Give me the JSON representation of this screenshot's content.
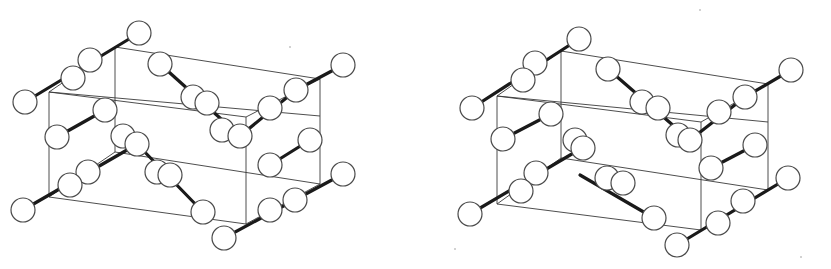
{
  "figure": {
    "kind": "stereo-pair crystal structure (ball-and-stick, unit cell outlined)",
    "colors": {
      "background": "#ffffff",
      "atom_fill": "#ffffff",
      "atom_stroke": "#4a4a4a",
      "bond": "#1a1a1a",
      "frame": "#3a3a3a"
    },
    "atom_radius": 12,
    "views": [
      {
        "name": "left-view",
        "offset": [
          0,
          0
        ],
        "frame_lines": [
          [
            115,
            47,
            320,
            79
          ],
          [
            49,
            92,
            320,
            116
          ],
          [
            49,
            92,
            49,
            197
          ],
          [
            115,
            47,
            115,
            152
          ],
          [
            320,
            79,
            320,
            184
          ],
          [
            49,
            197,
            246,
            224
          ],
          [
            115,
            152,
            320,
            184
          ],
          [
            246,
            117,
            246,
            224
          ],
          [
            49,
            92,
            115,
            47
          ],
          [
            49,
            197,
            115,
            152
          ],
          [
            246,
            117,
            320,
            79
          ],
          [
            246,
            224,
            320,
            184
          ],
          [
            49,
            92,
            246,
            117
          ]
        ],
        "bonds": [
          [
            25,
            102,
            139,
            33
          ],
          [
            160,
            64,
            240,
            136
          ],
          [
            240,
            136,
            296,
            90
          ],
          [
            296,
            90,
            343,
            65
          ],
          [
            57,
            137,
            105,
            110
          ],
          [
            23,
            210,
            127,
            150
          ],
          [
            137,
            144,
            203,
            212
          ],
          [
            224,
            238,
            343,
            174
          ],
          [
            270,
            165,
            310,
            140
          ]
        ],
        "atoms": [
          [
            139,
            33
          ],
          [
            90,
            60
          ],
          [
            73,
            78
          ],
          [
            25,
            102
          ],
          [
            160,
            64
          ],
          [
            193,
            97
          ],
          [
            207,
            103
          ],
          [
            222,
            130
          ],
          [
            240,
            136
          ],
          [
            270,
            108
          ],
          [
            296,
            90
          ],
          [
            343,
            65
          ],
          [
            105,
            110
          ],
          [
            57,
            137
          ],
          [
            123,
            136
          ],
          [
            137,
            144
          ],
          [
            88,
            172
          ],
          [
            70,
            185
          ],
          [
            23,
            210
          ],
          [
            157,
            172
          ],
          [
            170,
            175
          ],
          [
            203,
            212
          ],
          [
            270,
            165
          ],
          [
            310,
            140
          ],
          [
            270,
            210
          ],
          [
            295,
            200
          ],
          [
            343,
            174
          ],
          [
            224,
            238
          ]
        ]
      },
      {
        "name": "right-view",
        "offset": [
          0,
          0
        ],
        "frame_lines": [
          [
            561,
            51,
            768,
            84
          ],
          [
            497,
            96,
            768,
            122
          ],
          [
            497,
            96,
            497,
            204
          ],
          [
            561,
            51,
            561,
            158
          ],
          [
            768,
            84,
            768,
            190
          ],
          [
            497,
            204,
            701,
            230
          ],
          [
            561,
            158,
            768,
            190
          ],
          [
            701,
            122,
            701,
            230
          ],
          [
            497,
            96,
            561,
            51
          ],
          [
            497,
            204,
            561,
            158
          ],
          [
            701,
            122,
            768,
            84
          ],
          [
            701,
            230,
            768,
            190
          ],
          [
            497,
            96,
            701,
            122
          ]
        ],
        "bonds": [
          [
            472,
            108,
            579,
            39
          ],
          [
            608,
            69,
            690,
            140
          ],
          [
            690,
            140,
            745,
            97
          ],
          [
            745,
            97,
            791,
            70
          ],
          [
            503,
            139,
            551,
            114
          ],
          [
            470,
            214,
            582,
            148
          ],
          [
            580,
            175,
            654,
            218
          ],
          [
            677,
            245,
            788,
            178
          ],
          [
            711,
            168,
            755,
            145
          ]
        ],
        "atoms": [
          [
            579,
            39
          ],
          [
            535,
            63
          ],
          [
            523,
            80
          ],
          [
            472,
            108
          ],
          [
            608,
            69
          ],
          [
            642,
            102
          ],
          [
            658,
            108
          ],
          [
            678,
            135
          ],
          [
            690,
            140
          ],
          [
            719,
            112
          ],
          [
            745,
            97
          ],
          [
            791,
            70
          ],
          [
            551,
            114
          ],
          [
            503,
            139
          ],
          [
            575,
            140
          ],
          [
            583,
            148
          ],
          [
            536,
            173
          ],
          [
            521,
            191
          ],
          [
            470,
            214
          ],
          [
            607,
            178
          ],
          [
            623,
            183
          ],
          [
            654,
            218
          ],
          [
            711,
            168
          ],
          [
            755,
            145
          ],
          [
            718,
            223
          ],
          [
            743,
            201
          ],
          [
            788,
            178
          ],
          [
            677,
            245
          ]
        ]
      }
    ],
    "specks": [
      [
        290,
        47
      ],
      [
        801,
        257
      ],
      [
        455,
        249
      ],
      [
        700,
        10
      ]
    ]
  }
}
